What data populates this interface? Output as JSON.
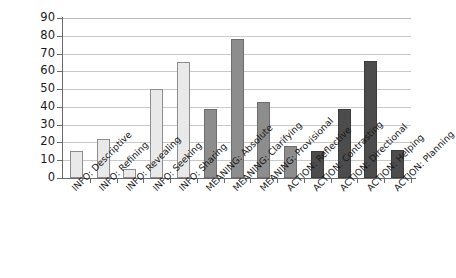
{
  "chart_data": {
    "type": "bar",
    "title": "",
    "subtitle": "",
    "xlabel": "",
    "ylabel": "",
    "ylim": [
      0,
      90
    ],
    "ytick_step": 10,
    "yticks": [
      90,
      80,
      70,
      60,
      50,
      40,
      30,
      20,
      10,
      0
    ],
    "grid": true,
    "grid_axis": "y",
    "legend": false,
    "legend_position": "none",
    "categories": [
      "INFO: Descriptive",
      "INFO: Refining",
      "INFO: Revealing",
      "INFO: Seeking",
      "INFO: Sharing",
      "MEANING: Absolute",
      "MEANING: Clarifying",
      "MEANING: Provisional",
      "ACTION: Reflective",
      "ACTION: Contrasting",
      "ACTION: Directional",
      "ACTION: Helping",
      "ACTION: Planning"
    ],
    "values": [
      15,
      22,
      5,
      50,
      65,
      39,
      78,
      43,
      18,
      15,
      39,
      66,
      16
    ],
    "bar_shades": [
      "light",
      "light",
      "light",
      "light",
      "light",
      "medium",
      "medium",
      "medium",
      "medium",
      "dark",
      "dark",
      "dark",
      "dark"
    ],
    "series": [
      {
        "name": "Utterance counts",
        "values": [
          15,
          22,
          5,
          50,
          65,
          39,
          78,
          43,
          18,
          15,
          39,
          66,
          16
        ]
      }
    ],
    "colors": {
      "shade_light_fill": "#e9e9e9",
      "shade_light_edge": "#8d8d8d",
      "shade_medium_fill": "#8d8d8d",
      "shade_medium_edge": "#6e6e6e",
      "shade_dark_fill": "#4c4c4c",
      "shade_dark_edge": "#3c3c3c",
      "gridline": "#c9c9c9",
      "axis": "#6a6a6a",
      "text": "#1a1a1a",
      "background": "#ffffff"
    }
  }
}
